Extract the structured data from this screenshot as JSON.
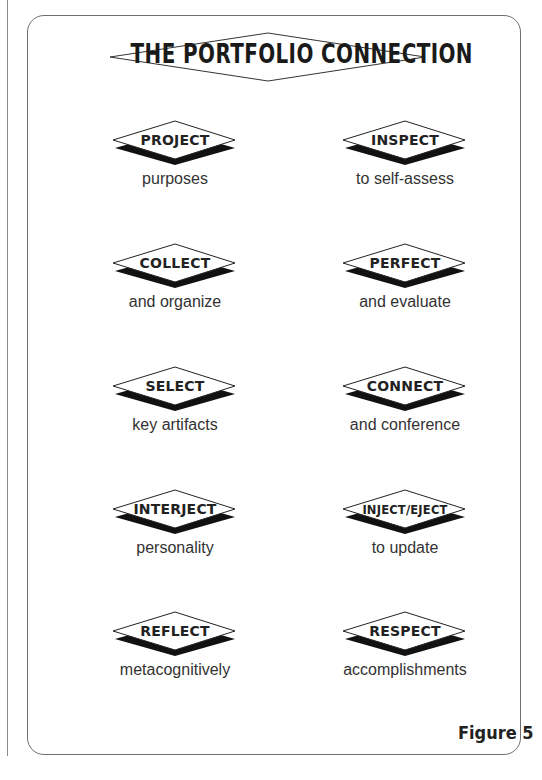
{
  "title": "THE PORTFOLIO CONNECTION",
  "figure_label": "Figure 5",
  "items": [
    {
      "word": "PROJECT",
      "caption": "purposes",
      "column": "left",
      "row": 1
    },
    {
      "word": "INSPECT",
      "caption": "to self-assess",
      "column": "right",
      "row": 1
    },
    {
      "word": "COLLECT",
      "caption": "and organize",
      "column": "left",
      "row": 2
    },
    {
      "word": "PERFECT",
      "caption": "and evaluate",
      "column": "right",
      "row": 2
    },
    {
      "word": "SELECT",
      "caption": "key artifacts",
      "column": "left",
      "row": 3
    },
    {
      "word": "CONNECT",
      "caption": "and conference",
      "column": "right",
      "row": 3
    },
    {
      "word": "INTERJECT",
      "caption": "personality",
      "column": "left",
      "row": 4
    },
    {
      "word": "INJECT/EJECT",
      "caption": "to update",
      "column": "right",
      "row": 4
    },
    {
      "word": "REFLECT",
      "caption": "metacognitively",
      "column": "left",
      "row": 5
    },
    {
      "word": "RESPECT",
      "caption": "accomplishments",
      "column": "right",
      "row": 5
    }
  ],
  "colors": {
    "frame": "#6f6f6f",
    "shadow": "#111111",
    "text": "#222222"
  }
}
